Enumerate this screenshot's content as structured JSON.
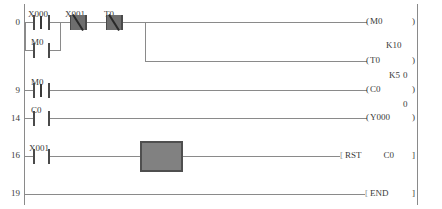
{
  "diagram": {
    "type": "ladder-logic",
    "rails": {
      "left_label": "power-rail-left",
      "right_label": "power-rail-right"
    },
    "line_color": "#8a8a8a",
    "symbol_color": "#4a4a4a",
    "cursor_color": "#818181"
  },
  "steps": [
    {
      "number": "0"
    },
    {
      "number": "9"
    },
    {
      "number": "14"
    },
    {
      "number": "16"
    },
    {
      "number": "19"
    }
  ],
  "rungs": [
    {
      "step": "0",
      "contacts": [
        {
          "device": "X000",
          "type": "pulse-rising"
        },
        {
          "device": "X001",
          "type": "normally-closed"
        },
        {
          "device": "T0",
          "type": "normally-closed"
        }
      ],
      "branch_contacts": [
        {
          "device": "M0",
          "type": "normally-open"
        }
      ],
      "outputs": [
        {
          "device": "M0",
          "type": "coil"
        },
        {
          "device": "T0",
          "type": "timer-coil",
          "preset": "K10",
          "current": "0"
        }
      ]
    },
    {
      "step": "9",
      "contacts": [
        {
          "device": "M0",
          "type": "pulse-rising"
        }
      ],
      "outputs": [
        {
          "device": "C0",
          "type": "counter-coil",
          "preset": "K5",
          "current": "0"
        }
      ]
    },
    {
      "step": "14",
      "contacts": [
        {
          "device": "C0",
          "type": "normally-open"
        }
      ],
      "outputs": [
        {
          "device": "Y000",
          "type": "coil"
        }
      ]
    },
    {
      "step": "16",
      "contacts": [
        {
          "device": "X001",
          "type": "normally-open"
        }
      ],
      "outputs": [
        {
          "device": "RST",
          "type": "instruction",
          "operand": "C0"
        }
      ],
      "cursor": true
    },
    {
      "step": "19",
      "contacts": [],
      "outputs": [
        {
          "device": "END",
          "type": "instruction",
          "operand": ""
        }
      ]
    }
  ],
  "labels": {
    "x000": "X000",
    "x001_r0": "X001",
    "t0_contact": "T0",
    "m0_branch": "M0",
    "m0_r9": "M0",
    "c0_r14": "C0",
    "x001_r16": "X001",
    "coil_m0": "M0",
    "coil_t0": "T0",
    "coil_c0": "C0",
    "coil_y000": "Y000",
    "instr_rst": "RST",
    "instr_rst_operand": "C0",
    "instr_end": "END",
    "preset_t0": "K10",
    "preset_c0": "K5",
    "current_t0": "0",
    "current_c0": "0",
    "paren_open": "(",
    "paren_close": ")",
    "bracket_open": "[",
    "bracket_close": "]"
  }
}
